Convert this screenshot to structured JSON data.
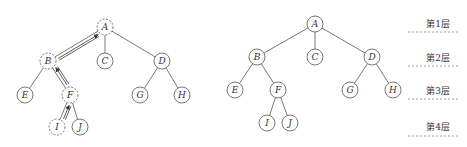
{
  "left_tree": {
    "nodes": [
      {
        "id": "A",
        "label": "A",
        "x": 105,
        "y": 27,
        "dashed": true
      },
      {
        "id": "B",
        "label": "B",
        "x": 48,
        "y": 61,
        "dashed": true
      },
      {
        "id": "C",
        "label": "C",
        "x": 105,
        "y": 61,
        "dashed": false
      },
      {
        "id": "D",
        "label": "D",
        "x": 162,
        "y": 61,
        "dashed": false
      },
      {
        "id": "E",
        "label": "E",
        "x": 25,
        "y": 95,
        "dashed": false
      },
      {
        "id": "F",
        "label": "F",
        "x": 70,
        "y": 95,
        "dashed": true
      },
      {
        "id": "G",
        "label": "G",
        "x": 140,
        "y": 95,
        "dashed": false
      },
      {
        "id": "H",
        "label": "H",
        "x": 182,
        "y": 95,
        "dashed": false
      },
      {
        "id": "I",
        "label": "I",
        "x": 57,
        "y": 127,
        "dashed": true
      },
      {
        "id": "J",
        "label": "J",
        "x": 80,
        "y": 127,
        "dashed": false
      }
    ],
    "edges": [
      [
        "A",
        "B"
      ],
      [
        "A",
        "C"
      ],
      [
        "A",
        "D"
      ],
      [
        "B",
        "E"
      ],
      [
        "B",
        "F"
      ],
      [
        "D",
        "G"
      ],
      [
        "D",
        "H"
      ],
      [
        "F",
        "I"
      ],
      [
        "F",
        "J"
      ]
    ],
    "path_arrows": [
      [
        "I",
        "F"
      ],
      [
        "F",
        "B"
      ],
      [
        "B",
        "A"
      ]
    ]
  },
  "right_tree": {
    "nodes": [
      {
        "id": "A",
        "label": "A",
        "x": 315,
        "y": 24
      },
      {
        "id": "B",
        "label": "B",
        "x": 257,
        "y": 57
      },
      {
        "id": "C",
        "label": "C",
        "x": 315,
        "y": 57
      },
      {
        "id": "D",
        "label": "D",
        "x": 372,
        "y": 57
      },
      {
        "id": "E",
        "label": "E",
        "x": 235,
        "y": 90
      },
      {
        "id": "F",
        "label": "F",
        "x": 278,
        "y": 90
      },
      {
        "id": "G",
        "label": "G",
        "x": 350,
        "y": 90
      },
      {
        "id": "H",
        "label": "H",
        "x": 393,
        "y": 90
      },
      {
        "id": "I",
        "label": "I",
        "x": 267,
        "y": 123
      },
      {
        "id": "J",
        "label": "J",
        "x": 290,
        "y": 123
      }
    ],
    "edges": [
      [
        "A",
        "B"
      ],
      [
        "A",
        "C"
      ],
      [
        "A",
        "D"
      ],
      [
        "B",
        "E"
      ],
      [
        "B",
        "F"
      ],
      [
        "D",
        "G"
      ],
      [
        "D",
        "H"
      ],
      [
        "F",
        "I"
      ],
      [
        "F",
        "J"
      ]
    ]
  },
  "levels": [
    {
      "label": "第1层",
      "y": 23,
      "line_y": 32
    },
    {
      "label": "第2层",
      "y": 57,
      "line_y": 66
    },
    {
      "label": "第3层",
      "y": 90,
      "line_y": 99
    },
    {
      "label": "第4层",
      "y": 126,
      "line_y": 136
    }
  ]
}
